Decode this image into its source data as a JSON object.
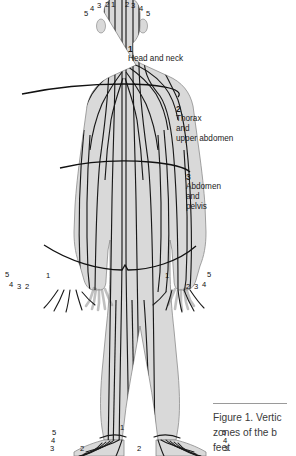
{
  "figure": {
    "silhouette_color": "#d9d9d9",
    "silhouette_edge_color": "#8c8c8c",
    "meridian_color": "#1a1a1a",
    "divider_color": "#111111",
    "background": "#ffffff"
  },
  "zones": [
    {
      "number": "1",
      "name_lines": [
        "Head and neck"
      ]
    },
    {
      "number": "2",
      "name_lines": [
        "Thorax",
        "and",
        "upper abdomen"
      ]
    },
    {
      "number": "3",
      "name_lines": [
        "Abdomen",
        "and",
        "pelvis"
      ]
    }
  ],
  "head_digits": [
    "5",
    "4",
    "3",
    "2",
    "1",
    "2",
    "3",
    "4",
    "5"
  ],
  "left_hand_digits": [
    "5",
    "4",
    "3",
    "2",
    "1"
  ],
  "right_hand_digits": [
    "1",
    "2",
    "3",
    "4",
    "5"
  ],
  "left_foot_digits": [
    "5",
    "4",
    "3",
    "2",
    "1"
  ],
  "right_foot_digits": [
    "1",
    "2",
    "3",
    "4",
    "5"
  ],
  "caption": {
    "lines": [
      "Figure 1. Vertic",
      "zones of the b",
      "feet"
    ]
  }
}
